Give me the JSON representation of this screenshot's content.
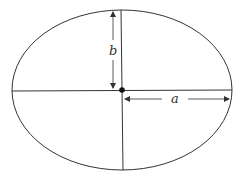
{
  "diagram": {
    "labels": {
      "semi_minor": "b",
      "semi_major": "a"
    },
    "colors": {
      "stroke": "#333333",
      "background": "#ffffff"
    }
  }
}
